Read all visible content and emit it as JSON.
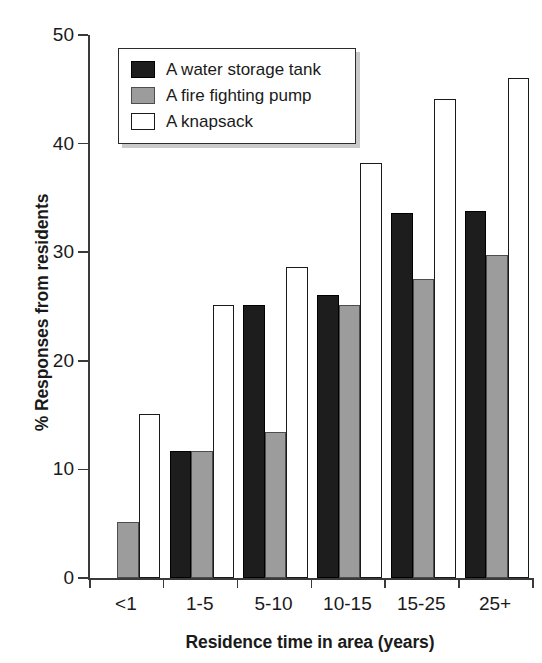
{
  "chart_data": {
    "type": "bar",
    "title": "",
    "xlabel": "Residence time in area (years)",
    "ylabel": "% Responses from residents",
    "categories": [
      "<1",
      "1-5",
      "5-10",
      "10-15",
      "15-25",
      "25+"
    ],
    "series": [
      {
        "name": "A water storage tank",
        "color": "#1d1d1d",
        "fill": "black",
        "values": [
          0,
          11.7,
          25.1,
          26.1,
          33.6,
          33.8
        ]
      },
      {
        "name": "A fire fighting pump",
        "color": "#9c9c9c",
        "fill": "gray",
        "values": [
          5.2,
          11.7,
          13.4,
          25.1,
          27.5,
          29.7
        ]
      },
      {
        "name": "A knapsack",
        "color": "#ffffff",
        "fill": "white",
        "values": [
          15.1,
          25.1,
          28.6,
          38.2,
          44.1,
          46.0
        ]
      }
    ],
    "ylim": [
      0,
      50
    ],
    "yticks": [
      0,
      10,
      20,
      30,
      40,
      50
    ],
    "ytick_labels": [
      "0",
      "10",
      "20",
      "30",
      "40",
      "50"
    ],
    "grid": false,
    "legend_position": "top-left-inside",
    "legend_entries": [
      "A water storage tank",
      "A fire fighting pump",
      "A knapsack"
    ]
  },
  "axes": {
    "y_title": "% Responses from residents",
    "x_title": "Residence time in area (years)"
  },
  "colors": {
    "black_series": "#1d1d1d",
    "gray_series": "#9c9c9c",
    "white_series": "#ffffff",
    "axis": "#3a3a3a",
    "legend_shadow": "#c9c9c9"
  }
}
